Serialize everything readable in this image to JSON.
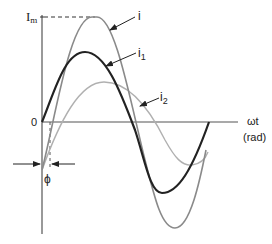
{
  "diagram": {
    "type": "waveform",
    "labels": {
      "peak": "I",
      "peak_sub": "m",
      "origin": "0",
      "x_axis": "ωt",
      "x_axis_unit": "(rad)",
      "phase": "ϕ"
    },
    "curves": [
      {
        "id": "i",
        "label": "i",
        "sub": "",
        "color": "#8a8a8a",
        "width": 1.6
      },
      {
        "id": "i1",
        "label": "i",
        "sub": "1",
        "color": "#222222",
        "width": 2.2
      },
      {
        "id": "i2",
        "label": "i",
        "sub": "2",
        "color": "#b0b0b0",
        "width": 1.4
      }
    ],
    "colors": {
      "axis": "#555555",
      "text": "#222222"
    }
  }
}
